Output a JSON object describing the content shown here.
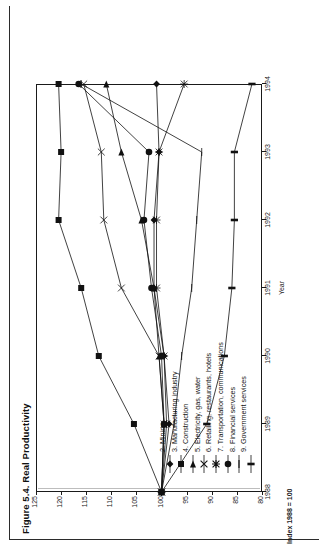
{
  "figure": {
    "title": "Figure 5.4. Real Productivity",
    "rotation": "90deg-counterclockwise"
  },
  "axes": {
    "ylabel": "Index 1988 = 100",
    "xlabel": "Year",
    "yticks": [
      "125",
      "120",
      "115",
      "110",
      "105",
      "100",
      "95",
      "90",
      "85",
      "80"
    ],
    "xticks": [
      "1988",
      "1989",
      "1990",
      "1991",
      "1992",
      "1993",
      "1994"
    ]
  },
  "legend": {
    "items": [
      {
        "label": "2. Mining",
        "marker": "diamond"
      },
      {
        "label": "3. Manufacturing industry",
        "marker": "square"
      },
      {
        "label": "4. Construction",
        "marker": "triangle"
      },
      {
        "label": "5. Electricity, gas, water",
        "marker": "x"
      },
      {
        "label": "6. Retailing, restaurants, hotels",
        "marker": "asterisk"
      },
      {
        "label": "7. Transportation, communications",
        "marker": "circle"
      },
      {
        "label": "8. Financial services",
        "marker": "plus"
      },
      {
        "label": "9. Government services",
        "marker": "bar"
      }
    ]
  },
  "chart_data": {
    "type": "line",
    "title": "Figure 5.4. Real Productivity",
    "xlabel": "Year",
    "ylabel": "Index 1988 = 100",
    "x": [
      1988,
      1989,
      1990,
      1991,
      1992,
      1993,
      1994
    ],
    "ylim": [
      80,
      125
    ],
    "xlim": [
      1988,
      1994
    ],
    "grid": false,
    "legend_position": "inside-lower-left",
    "series": [
      {
        "name": "2. Mining",
        "marker": "diamond",
        "values": [
          100.0,
          98.5,
          99.5,
          101.5,
          101.5,
          100.5,
          101.0
        ]
      },
      {
        "name": "3. Manufacturing industry",
        "marker": "square",
        "values": [
          100.0,
          105.5,
          112.5,
          116.0,
          120.5,
          120.0,
          120.5
        ]
      },
      {
        "name": "4. Construction",
        "marker": "triangle",
        "values": [
          100.0,
          99.5,
          100.5,
          101.5,
          104.0,
          108.0,
          111.0
        ]
      },
      {
        "name": "5. Electricity, gas, water",
        "marker": "x",
        "values": [
          100.0,
          99.5,
          100.5,
          108.0,
          111.5,
          112.0,
          115.5
        ]
      },
      {
        "name": "6. Retailing, restaurants, hotels",
        "marker": "asterisk",
        "values": [
          100.0,
          99.0,
          99.5,
          101.0,
          101.0,
          100.5,
          95.5
        ]
      },
      {
        "name": "7. Transportation, communications",
        "marker": "circle",
        "values": [
          100.0,
          99.5,
          100.0,
          102.0,
          103.5,
          102.5,
          116.5
        ]
      },
      {
        "name": "8. Financial services",
        "marker": "plus",
        "values": [
          100.0,
          97.5,
          96.0,
          94.0,
          93.0,
          92.0,
          116.0
        ]
      },
      {
        "name": "9. Government services",
        "marker": "bar",
        "values": [
          100.0,
          91.0,
          87.5,
          86.0,
          85.5,
          85.5,
          82.0
        ]
      }
    ]
  }
}
